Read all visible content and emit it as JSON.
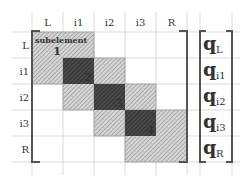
{
  "columns": [
    "L",
    "i1",
    "i2",
    "i3",
    "R"
  ],
  "rows": [
    "L",
    "i1",
    "i2",
    "i3",
    "R"
  ],
  "submatrix_caption": "subelement",
  "submatrices": [
    {
      "label": "1",
      "start": 0
    },
    {
      "label": "2",
      "start": 1
    },
    {
      "label": "3",
      "start": 2
    },
    {
      "label": "4",
      "start": 3
    }
  ],
  "overlap_cells": [
    1,
    2,
    3
  ],
  "vector": {
    "symbol": "q",
    "subscripts": [
      "L",
      "i1",
      "i2",
      "i3",
      "R"
    ]
  },
  "colors": {
    "grid": "#d0d0d0",
    "bracket": "#555555",
    "hatch_light": "#bdbdbd",
    "overlap_dark": "#3a3a3a"
  }
}
